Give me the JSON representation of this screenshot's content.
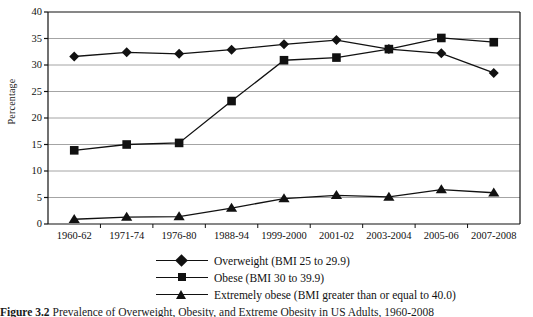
{
  "chart_data": {
    "type": "line",
    "title": "",
    "xlabel": "",
    "ylabel": "Percentage",
    "ylim": [
      0,
      40
    ],
    "ytick_step": 5,
    "yticks": [
      "0",
      "5",
      "10",
      "15",
      "20",
      "25",
      "30",
      "35",
      "40"
    ],
    "grid": "horizontal",
    "legend_position": "bottom",
    "categories": [
      "1960-62",
      "1971-74",
      "1976-80",
      "1988-94",
      "1999-2000",
      "2001-02",
      "2003-2004",
      "2005-06",
      "2007-2008"
    ],
    "series": [
      {
        "name": "Overweight (BMI 25 to 29.9)",
        "marker": "diamond",
        "color": "#111111",
        "values": [
          31.6,
          32.4,
          32.1,
          32.9,
          33.9,
          34.7,
          33.0,
          32.2,
          28.5
        ]
      },
      {
        "name": "Obese (BMI 30 to 39.9)",
        "marker": "square",
        "color": "#111111",
        "values": [
          13.9,
          15.0,
          15.3,
          23.2,
          30.9,
          31.4,
          33.0,
          35.1,
          34.3
        ]
      },
      {
        "name": "Extremely obese (BMI greater than or equal to 40.0)",
        "marker": "triangle",
        "color": "#111111",
        "values": [
          0.9,
          1.3,
          1.4,
          3.0,
          4.8,
          5.4,
          5.1,
          6.5,
          5.9
        ]
      }
    ]
  },
  "legend": [
    {
      "marker": "diamond",
      "label": "Overweight (BMI 25 to 29.9)"
    },
    {
      "marker": "square",
      "label": "Obese (BMI 30 to 39.9)"
    },
    {
      "marker": "triangle",
      "label": "Extremely obese (BMI greater than or equal to 40.0)"
    }
  ],
  "caption": {
    "figure_number": "Figure 3.2",
    "text": "Prevalence of Overweight, Obesity, and Extreme Obesity in US Adults, 1960-2008"
  }
}
